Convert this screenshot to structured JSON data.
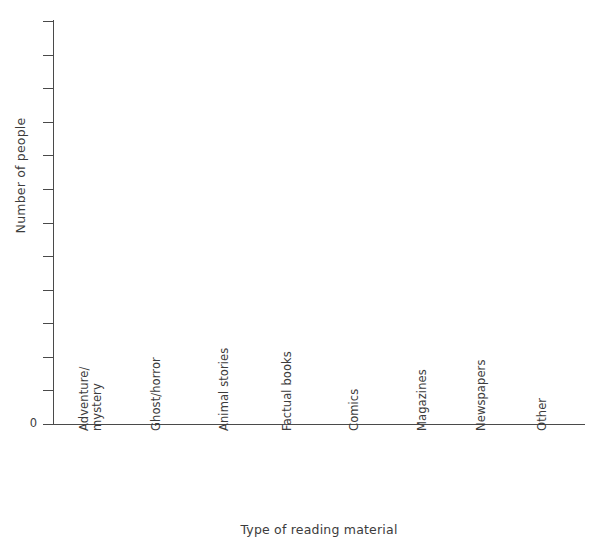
{
  "chart_data": {
    "type": "bar",
    "title": "",
    "title_remnant": "· ·",
    "xlabel": "Type of reading material",
    "ylabel": "Number of people",
    "categories": [
      "Adventure/\nmystery",
      "Ghost/horror",
      "Animal stories",
      "Factual books",
      "Comics",
      "Magazines",
      "Newspapers",
      "Other"
    ],
    "values": [
      null,
      null,
      null,
      null,
      null,
      null,
      null,
      null
    ],
    "series": [
      {
        "name": "Number of people",
        "values": [
          null,
          null,
          null,
          null,
          null,
          null,
          null,
          null
        ]
      }
    ],
    "ytick_labels": [
      "0",
      "",
      "",
      "",
      "",
      "",
      "",
      "",
      "",
      "",
      "",
      "",
      ""
    ],
    "ytick_count": 13,
    "ylim": [
      0,
      12
    ],
    "xlim_categories": 8,
    "grid": false,
    "legend": false,
    "legend_position": "none",
    "note": "Blank axes template — no bars plotted; y-axis scale unlabelled except 0",
    "colors": {
      "axis": "#4a4a4a",
      "text": "#3c3c3c",
      "background": "#ffffff",
      "title_remnant": "#d8d8dc"
    }
  },
  "axes": {
    "y": {
      "label": "Number of people",
      "zero_label": "0",
      "tick_marks": 13
    },
    "x": {
      "label": "Type of reading material",
      "tick_marks": 0
    }
  }
}
